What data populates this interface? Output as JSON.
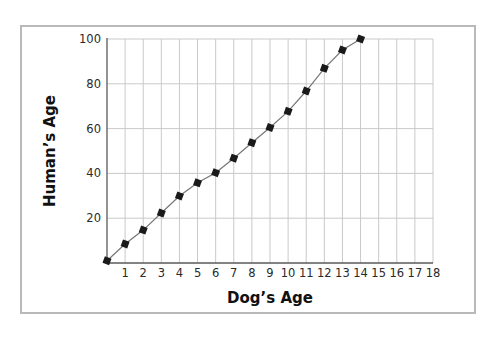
{
  "chart_data": {
    "type": "line",
    "title": "",
    "xlabel": "Dog’s Age",
    "ylabel": "Human’s Age",
    "xlim": [
      0,
      18
    ],
    "ylim": [
      0,
      100
    ],
    "x_ticks": [
      1,
      2,
      3,
      4,
      5,
      6,
      7,
      8,
      9,
      10,
      11,
      12,
      13,
      14,
      15,
      16,
      17,
      18
    ],
    "y_ticks": [
      20,
      40,
      60,
      80,
      100
    ],
    "grid": true,
    "legend": null,
    "series": [
      {
        "name": "Human's Age",
        "marker": "square",
        "color": "#1a1a1a",
        "line_color": "#777777",
        "x": [
          0,
          1,
          2,
          3,
          4,
          5,
          6,
          7,
          8,
          9,
          10,
          11,
          12,
          13,
          14
        ],
        "values": [
          1,
          8.5,
          14.7,
          22.3,
          29.9,
          35.8,
          40.3,
          46.8,
          53.7,
          60.5,
          67.7,
          76.8,
          86.9,
          95.1,
          100
        ]
      }
    ]
  },
  "style": {
    "frame_color": "#b9b9b9",
    "grid_color": "#c9c9c9",
    "axis_color": "#5a5a5a",
    "marker_color": "#1a1a1a",
    "line_color": "#7a7a7a"
  }
}
